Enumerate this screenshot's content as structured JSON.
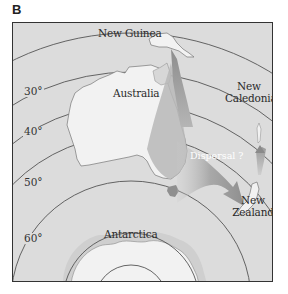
{
  "figure": {
    "panel_label": "B"
  },
  "labels": {
    "new_guinea": "New Guinea",
    "australia": "Australia",
    "new_caledonia_line1": "New",
    "new_caledonia_line2": "Caledonia",
    "new_zealand_line1": "New",
    "new_zealand_line2": "Zealand",
    "antarctica": "Antarctica",
    "dispersal": "Dispersal ?"
  },
  "latitudes": [
    {
      "label": "30°"
    },
    {
      "label": "40°"
    },
    {
      "label": "50°"
    },
    {
      "label": "60°"
    }
  ],
  "colors": {
    "ocean": "#dcdcdc",
    "land": "#f2f2f2",
    "arrow_shading": "#9a9a9a",
    "latitude_lines": "#555555",
    "frame": "#333333"
  }
}
